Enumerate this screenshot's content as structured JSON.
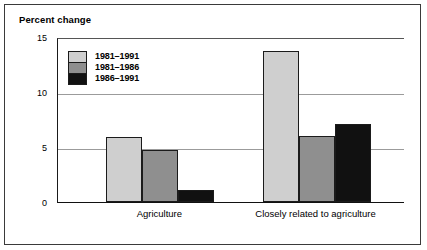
{
  "chart_data": {
    "type": "bar",
    "title": "Percent change",
    "xlabel": "",
    "ylabel": "Percent change",
    "ylim": [
      0,
      15
    ],
    "yticks": [
      0,
      5,
      10,
      15
    ],
    "ytick_labels": [
      "0",
      "5",
      "10",
      "15"
    ],
    "gridlines": [
      5,
      10
    ],
    "grid": true,
    "legend_position": "top-left",
    "categories": [
      "Agriculture",
      "Closely related to agriculture"
    ],
    "series": [
      {
        "name": "1981–1991",
        "color": "#cfcfcf",
        "values": [
          5.9,
          13.7
        ]
      },
      {
        "name": "1981–1986",
        "color": "#8f8f8f",
        "values": [
          4.7,
          6.0
        ]
      },
      {
        "name": "1986–1991",
        "color": "#111111",
        "values": [
          1.1,
          7.1
        ]
      }
    ]
  },
  "style": {
    "frame_color": "#3a3a3a",
    "axis_color": "#111111",
    "gridline_color": "#9b9b9b",
    "bar_outline": "#1b1b1b",
    "background": "#ffffff"
  }
}
